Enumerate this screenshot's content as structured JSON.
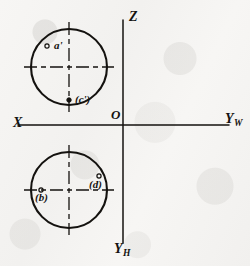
{
  "drawing": {
    "title": "Orthographic projection of a sphere with point projections",
    "background_color": "#f6f5f3",
    "ink_color": "#14120f"
  },
  "axes": {
    "x_label": "X",
    "z_label": "Z",
    "yw_label": "Y",
    "yw_subscript": "W",
    "yh_label": "Y",
    "yh_subscript": "H",
    "origin_label": "O",
    "horizontal": {
      "x1": 18,
      "y1": 125,
      "x2": 229,
      "y2": 125
    },
    "vertical": {
      "x1": 123,
      "y1": 20,
      "x2": 123,
      "y2": 243
    }
  },
  "views": [
    {
      "name": "front-view-circle",
      "cx": 69,
      "cy": 67,
      "r": 38,
      "centerline_h": {
        "x1": 24,
        "x2": 114,
        "y": 67
      },
      "centerline_v": {
        "y1": 22,
        "y2": 112,
        "x": 69
      }
    },
    {
      "name": "top-view-circle",
      "cx": 69,
      "cy": 190,
      "r": 38,
      "centerline_h": {
        "x1": 24,
        "x2": 114,
        "y": 190
      },
      "centerline_v": {
        "y1": 145,
        "y2": 235,
        "x": 69
      }
    }
  ],
  "points": [
    {
      "id": "a-prime",
      "label": "a'",
      "marker": "open-circle",
      "marker_x": 47,
      "marker_y": 46,
      "label_x": 54,
      "label_y": 41
    },
    {
      "id": "c-prime",
      "label": "(c')",
      "marker": "filled-dot",
      "marker_x": 69,
      "marker_y": 100,
      "label_x": 75,
      "label_y": 94
    },
    {
      "id": "b",
      "label": "(b)",
      "marker": "open-circle",
      "marker_x": 41,
      "marker_y": 190,
      "label_x": 36,
      "label_y": 193
    },
    {
      "id": "d",
      "label": "(d)",
      "marker": "open-circle",
      "marker_x": 99,
      "marker_y": 176,
      "label_x": 90,
      "label_y": 180
    }
  ]
}
